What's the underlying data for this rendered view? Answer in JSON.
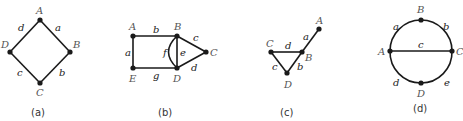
{
  "figures": [
    {
      "caption": "(a)",
      "vertices": {
        "A": "A",
        "B": "B",
        "C": "C",
        "D": "D"
      },
      "edges": {
        "a": "a",
        "b": "b",
        "c": "c",
        "d": "d"
      }
    },
    {
      "caption": "(b)",
      "vertices": {
        "A": "A",
        "B": "B",
        "C": "C",
        "D": "D",
        "E": "E"
      },
      "edges": {
        "a": "a",
        "b": "b",
        "c": "c",
        "d": "d",
        "e": "e",
        "f": "f",
        "g": "g"
      }
    },
    {
      "caption": "(c)",
      "vertices": {
        "A": "A",
        "B": "B",
        "C": "C",
        "D": "D"
      },
      "edges": {
        "a": "a",
        "b": "b",
        "c": "c",
        "d": "d"
      }
    },
    {
      "caption": "(d)",
      "vertices": {
        "A": "A",
        "B": "B",
        "C": "C",
        "D": "D"
      },
      "edges": {
        "a": "a",
        "b": "b",
        "c": "c",
        "d": "d",
        "e": "e"
      }
    }
  ],
  "colors": {
    "edge": "#1a1a1a",
    "vertex": "#1a1a1a",
    "vertex_label": "#555555"
  }
}
